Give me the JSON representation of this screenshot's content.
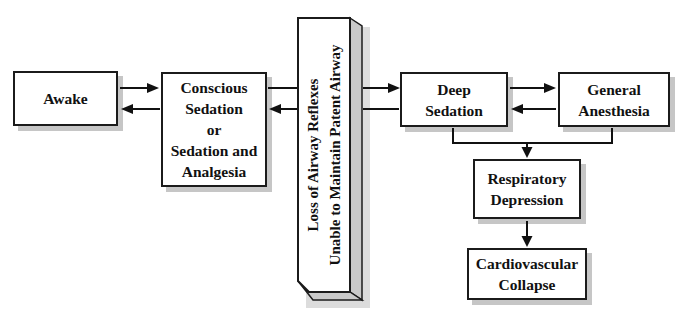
{
  "figure": {
    "type": "flow-diagram"
  },
  "palette": {
    "background": "#ffffff",
    "line": "#111111",
    "box_fill": "#ffffff",
    "box_border": "#1b1b1b",
    "box_shadow": "#c6c6c6",
    "bar_side_fill": "#c9c9c9",
    "bar_outer_shadow": "#dcdcdc",
    "text": "#111111"
  },
  "nodes": {
    "awake": {
      "lines": [
        "Awake"
      ]
    },
    "conscious_sedation": {
      "lines": [
        "Conscious",
        "Sedation",
        "or",
        "Sedation and",
        "Analgesia"
      ]
    },
    "airway_bar": {
      "lines": [
        "Loss of Airway Reflexes",
        "Unable to Maintain Patent Airway"
      ]
    },
    "deep_sedation": {
      "lines": [
        "Deep",
        "Sedation"
      ]
    },
    "general_anesthesia": {
      "lines": [
        "General",
        "Anesthesia"
      ]
    },
    "respiratory_depression": {
      "lines": [
        "Respiratory",
        "Depression"
      ]
    },
    "cardiovascular_collapse": {
      "lines": [
        "Cardiovascular",
        "Collapse"
      ]
    }
  },
  "edges": [
    {
      "from": "awake",
      "to": "conscious_sedation",
      "arrow": "right"
    },
    {
      "from": "conscious_sedation",
      "to": "awake",
      "arrow": "left"
    },
    {
      "from": "conscious_sedation",
      "to": "deep_sedation",
      "arrow": "right",
      "through": "airway_bar"
    },
    {
      "from": "deep_sedation",
      "to": "conscious_sedation",
      "arrow": "left",
      "through": "airway_bar"
    },
    {
      "from": "deep_sedation",
      "to": "general_anesthesia",
      "arrow": "right"
    },
    {
      "from": "general_anesthesia",
      "to": "deep_sedation",
      "arrow": "left"
    },
    {
      "from": [
        "deep_sedation",
        "general_anesthesia"
      ],
      "to": "respiratory_depression",
      "arrow": "down"
    },
    {
      "from": "respiratory_depression",
      "to": "cardiovascular_collapse",
      "arrow": "down"
    }
  ]
}
